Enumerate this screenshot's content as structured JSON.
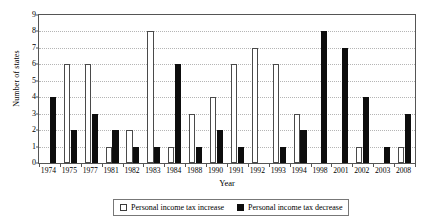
{
  "chart_data": {
    "type": "bar",
    "title": "",
    "xlabel": "Year",
    "ylabel": "Number of states",
    "ylim": [
      0,
      9
    ],
    "ytick_values": [
      0,
      1,
      2,
      3,
      4,
      5,
      6,
      7,
      8,
      9
    ],
    "grid": true,
    "legend_position": "bottom",
    "categories": [
      "1974",
      "1975",
      "1977",
      "1981",
      "1982",
      "1983",
      "1984",
      "1988",
      "1990",
      "1991",
      "1992",
      "1993",
      "1994",
      "1998",
      "2001",
      "2002",
      "2003",
      "2008"
    ],
    "series": [
      {
        "name": "Personal income tax increase",
        "color": "#ffffff",
        "values": [
          0,
          6,
          6,
          1,
          2,
          8,
          1,
          3,
          4,
          6,
          7,
          6,
          3,
          0,
          0,
          1,
          0,
          1
        ]
      },
      {
        "name": "Personal income tax decrease",
        "color": "#0d0d0d",
        "values": [
          4,
          2,
          3,
          2,
          1,
          1,
          6,
          1,
          2,
          1,
          0,
          1,
          2,
          8,
          7,
          4,
          1,
          3
        ]
      }
    ]
  },
  "axes": {
    "ylabel": "Number of states",
    "xlabel": "Year",
    "yticks": [
      "0",
      "1",
      "2",
      "3",
      "4",
      "5",
      "6",
      "7",
      "8",
      "9"
    ],
    "xticks": [
      "1974",
      "1975",
      "1977",
      "1981",
      "1982",
      "1983",
      "1984",
      "1988",
      "1990",
      "1991",
      "1992",
      "1993",
      "1994",
      "1998",
      "2001",
      "2002",
      "2003",
      "2008"
    ]
  },
  "legend": {
    "increase_label": "Personal income tax increase",
    "decrease_label": "Personal income tax decrease"
  }
}
